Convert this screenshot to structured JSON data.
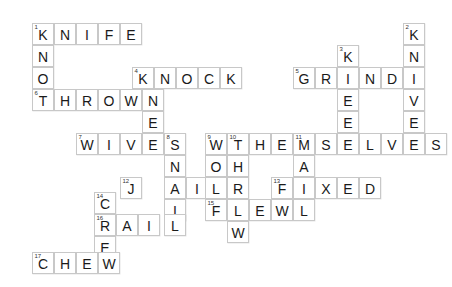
{
  "puzzle": {
    "type": "crossword",
    "title": "Crossword Puzzle Grid",
    "cell_size": 22,
    "origin_x": 32,
    "origin_y": 23,
    "colors": {
      "cell_fill": "#ffffff",
      "cell_border": "#c8c8c8",
      "letter": "#1a1a1a",
      "number": "#333333",
      "background": "#ffffff"
    },
    "entries": [
      {
        "number": "1",
        "direction": "across",
        "answer": "KNIFE",
        "row": 0,
        "col": 0
      },
      {
        "number": "1",
        "direction": "down",
        "answer": "KNOT",
        "row": 0,
        "col": 0
      },
      {
        "number": "2",
        "direction": "down",
        "answer": "KNIVES",
        "row": 0,
        "col": 17
      },
      {
        "number": "3",
        "direction": "down",
        "answer": "KNEE",
        "row": 1,
        "col": 15
      },
      {
        "number": "4",
        "direction": "across",
        "answer": "KNOCK",
        "row": 2,
        "col": 5
      },
      {
        "number": "4",
        "direction": "down",
        "answer": "KNEE",
        "row": 2,
        "col": 5
      },
      {
        "number": "5",
        "direction": "across",
        "answer": "GRIND",
        "row": 2,
        "col": 12
      },
      {
        "number": "6",
        "direction": "across",
        "answer": "THROWN",
        "row": 3,
        "col": 0
      },
      {
        "number": "7",
        "direction": "across",
        "answer": "WIVES",
        "row": 5,
        "col": 2
      },
      {
        "number": "8",
        "direction": "down",
        "answer": "SNAIL",
        "row": 5,
        "col": 6
      },
      {
        "number": "9",
        "direction": "down",
        "answer": "WOLF",
        "row": 5,
        "col": 8
      },
      {
        "number": "10",
        "direction": "across",
        "answer": "THEMSELVES",
        "row": 5,
        "col": 9
      },
      {
        "number": "10",
        "direction": "down",
        "answer": "THREW",
        "row": 5,
        "col": 9
      },
      {
        "number": "11",
        "direction": "down",
        "answer": "MAIL",
        "row": 5,
        "col": 12
      },
      {
        "number": "12",
        "direction": "across",
        "answer": "JAIL",
        "row": 6,
        "col": 5
      },
      {
        "number": "13",
        "direction": "across",
        "answer": "FIXED",
        "row": 7,
        "col": 11
      },
      {
        "number": "14",
        "direction": "down",
        "answer": "CREW",
        "row": 7,
        "col": 3
      },
      {
        "number": "15",
        "direction": "across",
        "answer": "FLEW",
        "row": 8,
        "col": 7
      },
      {
        "number": "16",
        "direction": "across",
        "answer": "CRAIL",
        "row": 8,
        "col": 3
      },
      {
        "number": "17",
        "direction": "across",
        "answer": "CHEW",
        "row": 10,
        "col": 0
      }
    ],
    "cells": [
      {
        "x": 32,
        "y": 23,
        "letter": "K",
        "number": "1"
      },
      {
        "x": 54,
        "y": 23,
        "letter": "N",
        "number": ""
      },
      {
        "x": 76,
        "y": 23,
        "letter": "I",
        "number": ""
      },
      {
        "x": 98,
        "y": 23,
        "letter": "F",
        "number": ""
      },
      {
        "x": 120,
        "y": 23,
        "letter": "E",
        "number": ""
      },
      {
        "x": 403,
        "y": 23,
        "letter": "K",
        "number": "2"
      },
      {
        "x": 32,
        "y": 45,
        "letter": "N",
        "number": ""
      },
      {
        "x": 337,
        "y": 45,
        "letter": "K",
        "number": "3"
      },
      {
        "x": 403,
        "y": 45,
        "letter": "N",
        "number": ""
      },
      {
        "x": 32,
        "y": 67,
        "letter": "O",
        "number": ""
      },
      {
        "x": 132,
        "y": 67,
        "letter": "K",
        "number": "4"
      },
      {
        "x": 154,
        "y": 67,
        "letter": "N",
        "number": ""
      },
      {
        "x": 176,
        "y": 67,
        "letter": "O",
        "number": ""
      },
      {
        "x": 198,
        "y": 67,
        "letter": "C",
        "number": ""
      },
      {
        "x": 220,
        "y": 67,
        "letter": "K",
        "number": ""
      },
      {
        "x": 293,
        "y": 67,
        "letter": "G",
        "number": "5"
      },
      {
        "x": 315,
        "y": 67,
        "letter": "R",
        "number": ""
      },
      {
        "x": 337,
        "y": 67,
        "letter": "I",
        "number": ""
      },
      {
        "x": 359,
        "y": 67,
        "letter": "N",
        "number": ""
      },
      {
        "x": 381,
        "y": 67,
        "letter": "D",
        "number": ""
      },
      {
        "x": 403,
        "y": 67,
        "letter": "I",
        "number": ""
      },
      {
        "x": 32,
        "y": 89,
        "letter": "T",
        "number": "6"
      },
      {
        "x": 54,
        "y": 89,
        "letter": "H",
        "number": ""
      },
      {
        "x": 76,
        "y": 89,
        "letter": "R",
        "number": ""
      },
      {
        "x": 98,
        "y": 89,
        "letter": "O",
        "number": ""
      },
      {
        "x": 120,
        "y": 89,
        "letter": "W",
        "number": ""
      },
      {
        "x": 142,
        "y": 89,
        "letter": "N",
        "number": ""
      },
      {
        "x": 337,
        "y": 89,
        "letter": "E",
        "number": ""
      },
      {
        "x": 403,
        "y": 89,
        "letter": "V",
        "number": ""
      },
      {
        "x": 142,
        "y": 111,
        "letter": "E",
        "number": ""
      },
      {
        "x": 337,
        "y": 111,
        "letter": "E",
        "number": ""
      },
      {
        "x": 403,
        "y": 111,
        "letter": "E",
        "number": ""
      },
      {
        "x": 76,
        "y": 133,
        "letter": "W",
        "number": "7"
      },
      {
        "x": 98,
        "y": 133,
        "letter": "I",
        "number": ""
      },
      {
        "x": 120,
        "y": 133,
        "letter": "V",
        "number": ""
      },
      {
        "x": 142,
        "y": 133,
        "letter": "E",
        "number": ""
      },
      {
        "x": 164,
        "y": 133,
        "letter": "S",
        "number": "8"
      },
      {
        "x": 205,
        "y": 133,
        "letter": "W",
        "number": "9"
      },
      {
        "x": 227,
        "y": 133,
        "letter": "T",
        "number": "10"
      },
      {
        "x": 249,
        "y": 133,
        "letter": "H",
        "number": ""
      },
      {
        "x": 271,
        "y": 133,
        "letter": "E",
        "number": ""
      },
      {
        "x": 293,
        "y": 133,
        "letter": "M",
        "number": "11"
      },
      {
        "x": 315,
        "y": 133,
        "letter": "S",
        "number": ""
      },
      {
        "x": 337,
        "y": 133,
        "letter": "E",
        "number": ""
      },
      {
        "x": 359,
        "y": 133,
        "letter": "L",
        "number": ""
      },
      {
        "x": 381,
        "y": 133,
        "letter": "V",
        "number": ""
      },
      {
        "x": 403,
        "y": 133,
        "letter": "E",
        "number": ""
      },
      {
        "x": 425,
        "y": 133,
        "letter": "S",
        "number": ""
      },
      {
        "x": 164,
        "y": 155,
        "letter": "N",
        "number": ""
      },
      {
        "x": 205,
        "y": 155,
        "letter": "O",
        "number": ""
      },
      {
        "x": 227,
        "y": 155,
        "letter": "H",
        "number": ""
      },
      {
        "x": 293,
        "y": 155,
        "letter": "A",
        "number": ""
      },
      {
        "x": 120,
        "y": 177,
        "letter": "J",
        "number": "12"
      },
      {
        "x": 164,
        "y": 177,
        "letter": "A",
        "number": ""
      },
      {
        "x": 186,
        "y": 177,
        "letter": "I",
        "number": ""
      },
      {
        "x": 205,
        "y": 177,
        "letter": "L",
        "number": ""
      },
      {
        "x": 227,
        "y": 177,
        "letter": "R",
        "number": ""
      },
      {
        "x": 271,
        "y": 177,
        "letter": "F",
        "number": "13"
      },
      {
        "x": 293,
        "y": 177,
        "letter": "I",
        "number": ""
      },
      {
        "x": 315,
        "y": 177,
        "letter": "X",
        "number": ""
      },
      {
        "x": 337,
        "y": 177,
        "letter": "E",
        "number": ""
      },
      {
        "x": 359,
        "y": 177,
        "letter": "D",
        "number": ""
      },
      {
        "x": 94,
        "y": 192,
        "letter": "C",
        "number": "14"
      },
      {
        "x": 164,
        "y": 199,
        "letter": "I",
        "number": ""
      },
      {
        "x": 205,
        "y": 199,
        "letter": "F",
        "number": "15"
      },
      {
        "x": 227,
        "y": 199,
        "letter": "L",
        "number": ""
      },
      {
        "x": 249,
        "y": 199,
        "letter": "E",
        "number": ""
      },
      {
        "x": 271,
        "y": 199,
        "letter": "W",
        "number": ""
      },
      {
        "x": 293,
        "y": 199,
        "letter": "L",
        "number": ""
      },
      {
        "x": 94,
        "y": 214,
        "letter": "R",
        "number": "16"
      },
      {
        "x": 116,
        "y": 214,
        "letter": "A",
        "number": ""
      },
      {
        "x": 138,
        "y": 214,
        "letter": "I",
        "number": ""
      },
      {
        "x": 164,
        "y": 214,
        "letter": "L",
        "number": ""
      },
      {
        "x": 227,
        "y": 221,
        "letter": "W",
        "number": ""
      },
      {
        "x": 94,
        "y": 236,
        "letter": "E",
        "number": ""
      },
      {
        "x": 32,
        "y": 252,
        "letter": "C",
        "number": "17"
      },
      {
        "x": 54,
        "y": 252,
        "letter": "H",
        "number": ""
      },
      {
        "x": 76,
        "y": 252,
        "letter": "E",
        "number": ""
      },
      {
        "x": 98,
        "y": 252,
        "letter": "W",
        "number": ""
      }
    ]
  }
}
